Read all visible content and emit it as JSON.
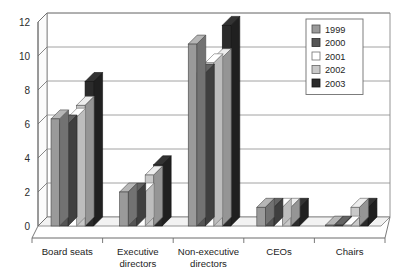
{
  "chart_data": {
    "type": "bar",
    "title": "",
    "subtitle": "",
    "xlabel": "",
    "ylabel": "",
    "ylim": [
      0,
      12
    ],
    "ytick_labels": [
      "0",
      "2",
      "4",
      "6",
      "8",
      "10",
      "12"
    ],
    "yticks": [
      0,
      2,
      4,
      6,
      8,
      10,
      12
    ],
    "grid": true,
    "grid_axis": "y",
    "legend_position": "top-right",
    "style": "3d-grouped-bar",
    "categories": [
      "Board seats",
      "Executive directors",
      "Non-executive directors",
      "CEOs",
      "Chairs"
    ],
    "category_lines": [
      [
        "Board seats"
      ],
      [
        "Executive",
        "directors"
      ],
      [
        "Non-executive",
        "directors"
      ],
      [
        "CEOs"
      ],
      [
        "Chairs"
      ]
    ],
    "series": [
      {
        "name": "1999",
        "color": "#9a9a9a",
        "values": [
          6.3,
          2.0,
          10.7,
          1.1,
          0.05
        ]
      },
      {
        "name": "2000",
        "color": "#555555",
        "values": [
          6.0,
          2.0,
          9.0,
          1.1,
          0.05
        ]
      },
      {
        "name": "2001",
        "color": "#ffffff",
        "values": [
          6.4,
          2.0,
          9.6,
          1.1,
          0.05
        ]
      },
      {
        "name": "2002",
        "color": "#c9c9c9",
        "values": [
          7.1,
          3.0,
          9.9,
          1.1,
          1.1
        ]
      },
      {
        "name": "2003",
        "color": "#2b2b2b",
        "values": [
          8.5,
          3.6,
          11.8,
          1.1,
          1.1
        ]
      }
    ]
  },
  "legend": {
    "entries": [
      {
        "label": "1999",
        "color": "#9a9a9a"
      },
      {
        "label": "2000",
        "color": "#555555"
      },
      {
        "label": "2001",
        "color": "#ffffff"
      },
      {
        "label": "2002",
        "color": "#c9c9c9"
      },
      {
        "label": "2003",
        "color": "#2b2b2b"
      }
    ]
  },
  "colors": {
    "axis": "#6b6b6b",
    "grid": "#8a8a8a",
    "frame": "#7a7a7a",
    "text": "#1d1d1d",
    "floor": "#f2f2f2",
    "back_wall": "#ffffff",
    "series_1999": "#9a9a9a",
    "series_2000": "#555555",
    "series_2001": "#ffffff",
    "series_2002": "#c9c9c9",
    "series_2003": "#2b2b2b"
  }
}
